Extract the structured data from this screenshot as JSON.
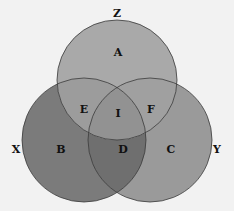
{
  "diagram": {
    "type": "venn",
    "sets": [
      {
        "id": "Z",
        "label": "Z",
        "cx": 117,
        "cy": 80,
        "r": 60,
        "only_region": "A"
      },
      {
        "id": "X",
        "label": "X",
        "cx": 84,
        "cy": 140,
        "r": 62,
        "only_region": "B"
      },
      {
        "id": "Y",
        "label": "Y",
        "cx": 150,
        "cy": 140,
        "r": 62,
        "only_region": "C"
      }
    ],
    "set_labels": {
      "Z": {
        "text": "Z",
        "x": 117,
        "y": 17
      },
      "X": {
        "text": "X",
        "x": 16,
        "y": 153
      },
      "Y": {
        "text": "Y",
        "x": 217,
        "y": 153
      }
    },
    "regions": {
      "A": {
        "text": "A",
        "x": 118,
        "y": 56,
        "sets": [
          "Z"
        ]
      },
      "B": {
        "text": "B",
        "x": 61,
        "y": 153,
        "sets": [
          "X"
        ]
      },
      "C": {
        "text": "C",
        "x": 171,
        "y": 153,
        "sets": [
          "Y"
        ]
      },
      "D": {
        "text": "D",
        "x": 123,
        "y": 153,
        "sets": [
          "X",
          "Y"
        ]
      },
      "E": {
        "text": "E",
        "x": 84,
        "y": 113,
        "sets": [
          "X",
          "Z"
        ]
      },
      "F": {
        "text": "F",
        "x": 151,
        "y": 113,
        "sets": [
          "Y",
          "Z"
        ]
      },
      "I": {
        "text": "I",
        "x": 118,
        "y": 117,
        "sets": [
          "X",
          "Y",
          "Z"
        ]
      }
    },
    "colors": {
      "background": "#f2f2f2",
      "Z": "#a9a9a9",
      "X": "#7b7b7b",
      "Y": "#9a9a9a",
      "outline": "#3a3a3a"
    }
  }
}
